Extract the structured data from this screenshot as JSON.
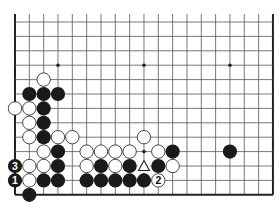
{
  "board": {
    "title": "Go board diagram (lower portion, 19 columns x 13 visible rows)",
    "columns": 19,
    "visible_rows": 13,
    "origin_x": 15,
    "origin_y": 22,
    "spacing_x": 14.33,
    "spacing_y": 14.4,
    "edges": {
      "left": true,
      "right": true,
      "bottom": true,
      "top": false
    },
    "star_points": [
      [
        3,
        3
      ],
      [
        9,
        3
      ],
      [
        15,
        3
      ],
      [
        3,
        9
      ],
      [
        9,
        9
      ],
      [
        15,
        9
      ]
    ],
    "colors": {
      "line": "#555555",
      "edge": "#222222",
      "black": "#1a1a1a",
      "white_fill": "#ffffff",
      "white_stroke": "#333333"
    },
    "stones": [
      {
        "c": 2,
        "r": 4,
        "color": "white"
      },
      {
        "c": 1,
        "r": 5,
        "color": "black"
      },
      {
        "c": 2,
        "r": 5,
        "color": "black"
      },
      {
        "c": 3,
        "r": 5,
        "color": "black"
      },
      {
        "c": 0,
        "r": 6,
        "color": "white"
      },
      {
        "c": 1,
        "r": 6,
        "color": "white"
      },
      {
        "c": 2,
        "r": 6,
        "color": "black"
      },
      {
        "c": 1,
        "r": 7,
        "color": "white"
      },
      {
        "c": 2,
        "r": 7,
        "color": "black"
      },
      {
        "c": 1,
        "r": 8,
        "color": "white"
      },
      {
        "c": 2,
        "r": 8,
        "color": "black"
      },
      {
        "c": 3,
        "r": 8,
        "color": "white"
      },
      {
        "c": 4,
        "r": 8,
        "color": "white"
      },
      {
        "c": 9,
        "r": 8,
        "color": "white"
      },
      {
        "c": 2,
        "r": 9,
        "color": "white"
      },
      {
        "c": 3,
        "r": 9,
        "color": "black"
      },
      {
        "c": 5,
        "r": 9,
        "color": "white"
      },
      {
        "c": 6,
        "r": 9,
        "color": "white"
      },
      {
        "c": 7,
        "r": 9,
        "color": "white"
      },
      {
        "c": 8,
        "r": 9,
        "color": "white"
      },
      {
        "c": 10,
        "r": 9,
        "color": "white"
      },
      {
        "c": 11,
        "r": 9,
        "color": "black"
      },
      {
        "c": 15,
        "r": 9,
        "color": "black"
      },
      {
        "c": 0,
        "r": 10,
        "color": "black",
        "label": "3"
      },
      {
        "c": 1,
        "r": 10,
        "color": "white"
      },
      {
        "c": 2,
        "r": 10,
        "color": "white"
      },
      {
        "c": 3,
        "r": 10,
        "color": "black"
      },
      {
        "c": 5,
        "r": 10,
        "color": "white"
      },
      {
        "c": 6,
        "r": 10,
        "color": "black"
      },
      {
        "c": 7,
        "r": 10,
        "color": "white"
      },
      {
        "c": 8,
        "r": 10,
        "color": "black"
      },
      {
        "c": 10,
        "r": 10,
        "color": "black"
      },
      {
        "c": 11,
        "r": 10,
        "color": "white"
      },
      {
        "c": 0,
        "r": 11,
        "color": "black",
        "label": "1"
      },
      {
        "c": 1,
        "r": 11,
        "color": "white"
      },
      {
        "c": 2,
        "r": 11,
        "color": "black"
      },
      {
        "c": 3,
        "r": 11,
        "color": "black"
      },
      {
        "c": 5,
        "r": 11,
        "color": "black"
      },
      {
        "c": 6,
        "r": 11,
        "color": "black"
      },
      {
        "c": 7,
        "r": 11,
        "color": "black"
      },
      {
        "c": 8,
        "r": 11,
        "color": "black"
      },
      {
        "c": 9,
        "r": 11,
        "color": "black"
      },
      {
        "c": 10,
        "r": 11,
        "color": "white",
        "label": "2"
      },
      {
        "c": 1,
        "r": 12,
        "color": "black"
      }
    ],
    "markers": [
      {
        "c": 9,
        "r": 10,
        "type": "triangle",
        "symbol": "△"
      }
    ]
  }
}
